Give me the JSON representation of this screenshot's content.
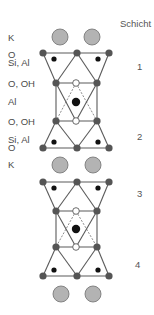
{
  "colors": {
    "line": "#5a5a5a",
    "node_O": "#555555",
    "cation": "#111111",
    "K_fill": "#b3b3b3",
    "K_stroke": "#7a7a7a",
    "OH_open_fill": "#ffffff",
    "text": "#4a4a4a"
  },
  "header": {
    "schicht_label": "Schicht"
  },
  "left_labels": [
    {
      "text": "K",
      "x": 8,
      "y": 41
    },
    {
      "text": "O",
      "x": 8,
      "y": 58
    },
    {
      "text": "Si, Al",
      "x": 8,
      "y": 66
    },
    {
      "text": "O, OH",
      "x": 8,
      "y": 87
    },
    {
      "text": "Al",
      "x": 8,
      "y": 105
    },
    {
      "text": "O, OH",
      "x": 8,
      "y": 125
    },
    {
      "text": "Si, Al",
      "x": 8,
      "y": 143
    },
    {
      "text": "O",
      "x": 8,
      "y": 151
    },
    {
      "text": "K",
      "x": 8,
      "y": 168
    }
  ],
  "layer_numbers": [
    {
      "text": "1",
      "x": 137,
      "y": 70
    },
    {
      "text": "2",
      "x": 137,
      "y": 140
    },
    {
      "text": "3",
      "x": 137,
      "y": 197
    },
    {
      "text": "4",
      "x": 135,
      "y": 268
    }
  ],
  "K_ions": [
    {
      "x": 60,
      "y": 37
    },
    {
      "x": 92,
      "y": 37
    },
    {
      "x": 60,
      "y": 165
    },
    {
      "x": 93,
      "y": 165
    },
    {
      "x": 61,
      "y": 294
    },
    {
      "x": 93,
      "y": 294
    }
  ],
  "units": [
    {
      "name": "unit-upper",
      "top_O": [
        43,
        77,
        109
      ],
      "top_y": 53,
      "tet_top_y": 59,
      "tet_x": [
        54,
        98
      ],
      "oh_top_y": 83,
      "oh_x": [
        56,
        97
      ],
      "open_x": 76,
      "al_y": 102,
      "oh_bot_y": 121,
      "tet_bot_y": 142,
      "bot_O": [
        43,
        77,
        109
      ],
      "bot_y": 148
    },
    {
      "name": "unit-lower",
      "top_O": [
        43,
        77,
        109
      ],
      "top_y": 182,
      "tet_top_y": 188,
      "tet_x": [
        54,
        98
      ],
      "oh_top_y": 211,
      "oh_x": [
        56,
        97
      ],
      "open_x": 76,
      "al_y": 229,
      "oh_bot_y": 247,
      "tet_bot_y": 270,
      "bot_O": [
        43,
        77,
        109
      ],
      "bot_y": 276
    }
  ]
}
